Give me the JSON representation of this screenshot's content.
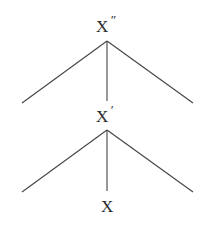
{
  "diagram": {
    "type": "x-bar syntax tree",
    "nodes": [
      {
        "id": "xbar2",
        "base": "X",
        "prime": "″",
        "label": "X″"
      },
      {
        "id": "xbar1",
        "base": "X",
        "prime": "′",
        "label": "X′"
      },
      {
        "id": "x0",
        "base": "X",
        "prime": "",
        "label": "X"
      }
    ],
    "edges": [
      {
        "from": "X″",
        "to": "left-branch"
      },
      {
        "from": "X″",
        "to": "X′"
      },
      {
        "from": "X″",
        "to": "right-branch"
      },
      {
        "from": "X′",
        "to": "left-branch"
      },
      {
        "from": "X′",
        "to": "X"
      },
      {
        "from": "X′",
        "to": "right-branch"
      }
    ],
    "colors": {
      "line": "#444444",
      "text": "#2a2a2a",
      "background": "#ffffff"
    }
  }
}
